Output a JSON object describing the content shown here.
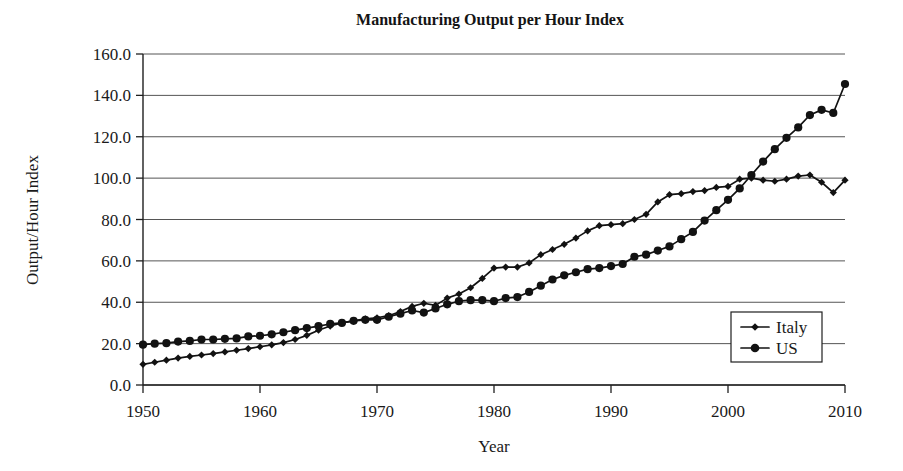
{
  "chart_data": {
    "type": "line",
    "title": "Manufacturing Output per Hour Index",
    "xlabel": "Year",
    "ylabel": "Output/Hour Index",
    "xlim": [
      1950,
      2010
    ],
    "ylim": [
      0.0,
      160.0
    ],
    "grid": true,
    "legend_position": "inner-bottom-right",
    "x_tick_labels": [
      "1950",
      "1960",
      "1970",
      "1980",
      "1990",
      "2000",
      "2010"
    ],
    "x_ticks": [
      1950,
      1960,
      1970,
      1980,
      1990,
      2000,
      2010
    ],
    "y_tick_labels": [
      "0.0",
      "20.0",
      "40.0",
      "60.0",
      "80.0",
      "100.0",
      "120.0",
      "140.0",
      "160.0"
    ],
    "y_ticks": [
      0,
      20,
      40,
      60,
      80,
      100,
      120,
      140,
      160
    ],
    "x": [
      1950,
      1951,
      1952,
      1953,
      1954,
      1955,
      1956,
      1957,
      1958,
      1959,
      1960,
      1961,
      1962,
      1963,
      1964,
      1965,
      1966,
      1967,
      1968,
      1969,
      1970,
      1971,
      1972,
      1973,
      1974,
      1975,
      1976,
      1977,
      1978,
      1979,
      1980,
      1981,
      1982,
      1983,
      1984,
      1985,
      1986,
      1987,
      1988,
      1989,
      1990,
      1991,
      1992,
      1993,
      1994,
      1995,
      1996,
      1997,
      1998,
      1999,
      2000,
      2001,
      2002,
      2003,
      2004,
      2005,
      2006,
      2007,
      2008,
      2009,
      2010
    ],
    "series": [
      {
        "name": "Italy",
        "marker": "diamond",
        "color": "#121212",
        "values": [
          10.0,
          11.0,
          12.0,
          13.0,
          13.8,
          14.5,
          15.2,
          16.0,
          16.8,
          17.6,
          18.5,
          19.4,
          20.5,
          22.0,
          24.0,
          26.5,
          28.5,
          30.0,
          31.0,
          32.0,
          32.5,
          33.5,
          35.5,
          38.0,
          39.5,
          38.5,
          42.0,
          44.0,
          47.0,
          51.5,
          56.5,
          57.0,
          57.0,
          59.0,
          63.0,
          65.5,
          68.0,
          71.0,
          74.5,
          77.0,
          77.5,
          78.0,
          80.0,
          82.5,
          88.5,
          92.0,
          92.5,
          93.5,
          94.0,
          95.5,
          96.0,
          99.5,
          100.0,
          99.0,
          98.5,
          99.5,
          101.0,
          101.5,
          98.0,
          93.0,
          99.0
        ]
      },
      {
        "name": "US",
        "marker": "circle",
        "color": "#121212",
        "values": [
          19.5,
          20.0,
          20.2,
          21.0,
          21.3,
          22.0,
          22.0,
          22.3,
          22.5,
          23.5,
          23.8,
          24.5,
          25.5,
          26.5,
          27.5,
          28.5,
          29.5,
          30.0,
          31.0,
          31.5,
          31.5,
          33.0,
          34.5,
          36.0,
          35.0,
          37.0,
          39.0,
          40.5,
          41.0,
          41.0,
          40.5,
          42.0,
          42.5,
          45.0,
          48.0,
          51.0,
          53.0,
          54.5,
          56.0,
          56.5,
          57.5,
          58.5,
          62.0,
          63.0,
          65.0,
          67.0,
          70.5,
          74.0,
          79.5,
          84.5,
          89.5,
          95.0,
          101.5,
          108.0,
          114.0,
          119.5,
          124.5,
          130.5,
          133.0,
          131.5,
          145.5
        ]
      }
    ]
  },
  "legend": {
    "items": [
      {
        "label": "Italy",
        "marker": "diamond"
      },
      {
        "label": "US",
        "marker": "circle"
      }
    ]
  }
}
